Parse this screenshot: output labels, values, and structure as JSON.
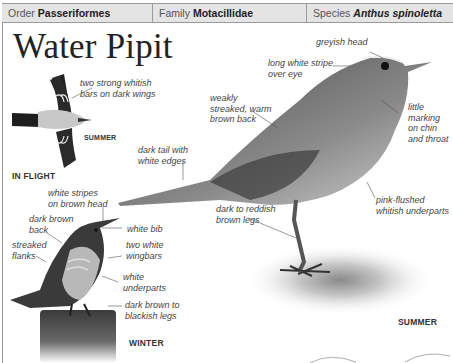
{
  "header": {
    "order_label": "Order",
    "order_value": "Passeriformes",
    "family_label": "Family",
    "family_value": "Motacillidae",
    "species_label": "Species",
    "species_value": "Anthus spinoletta"
  },
  "title": "Water Pipit",
  "captions": {
    "flight_summer": "SUMMER",
    "in_flight": "IN FLIGHT",
    "winter": "WINTER",
    "summer": "SUMMER"
  },
  "labels": {
    "flight_wingbars": "two strong whitish\nbars on dark wings",
    "greyish_head": "greyish head",
    "white_stripe": "long white stripe\nover eye",
    "back": "weakly\nstreaked, warm\nbrown back",
    "chin": "little\nmarking\non chin\nand throat",
    "tail": "dark tail with\nwhite edges",
    "underparts_summer": "pink-flushed\nwhitish underparts",
    "legs_summer": "dark to reddish\nbrown legs",
    "winter_head": "white stripes\non brown head",
    "winter_back": "dark brown\nback",
    "winter_bib": "white bib",
    "winter_flanks": "streaked\nflanks",
    "winter_wingbars": "two white\nwingbars",
    "winter_underparts": "white\nunderparts",
    "winter_legs": "dark brown to\nblackish legs"
  },
  "colors": {
    "header_bg": "#e4e4e4",
    "border": "#9a9a9a",
    "text": "#333333"
  }
}
